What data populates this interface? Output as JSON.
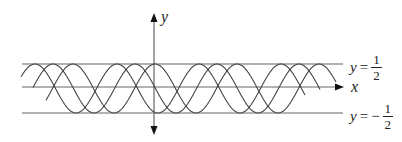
{
  "figure": {
    "axes": {
      "x_label": "x",
      "y_label": "y"
    },
    "bounds": {
      "upper": {
        "var": "y",
        "eq": "=",
        "sign": "",
        "num": "1",
        "den": "2"
      },
      "lower": {
        "var": "y",
        "eq": "=",
        "sign": "−",
        "num": "1",
        "den": "2"
      }
    },
    "curves": {
      "count": 3,
      "type": "shifted sinusoids between y = -1/2 and y = 1/2",
      "peak_phases_px": [
        35,
        53,
        73
      ],
      "period_px": 82
    },
    "colors": {
      "line": "#555555",
      "curve": "#444444",
      "text": "#222222"
    }
  }
}
